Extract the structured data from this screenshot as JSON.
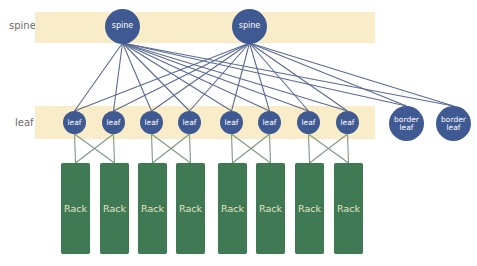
{
  "diagram": {
    "type": "spine-leaf network topology",
    "row_labels": {
      "spine": "spine",
      "leaf": "leaf"
    },
    "colors": {
      "band": "#f8edc8",
      "node": "#3f5a92",
      "node_text": "#ffffff",
      "spine_leaf_link": "#5a6a92",
      "leaf_rack_link": "#7e9a84",
      "rack": "#3f7a55",
      "rack_text": "#e6e4c4",
      "row_label": "#6b6b6b"
    },
    "spines": [
      {
        "label": "spine"
      },
      {
        "label": "spine"
      }
    ],
    "leafs": [
      {
        "label": "leaf"
      },
      {
        "label": "leaf"
      },
      {
        "label": "leaf"
      },
      {
        "label": "leaf"
      },
      {
        "label": "leaf"
      },
      {
        "label": "leaf"
      },
      {
        "label": "leaf"
      },
      {
        "label": "leaf"
      }
    ],
    "border_leafs": [
      {
        "line1": "border",
        "line2": "leaf"
      },
      {
        "line1": "border",
        "line2": "leaf"
      }
    ],
    "racks": [
      {
        "label": "Rack"
      },
      {
        "label": "Rack"
      },
      {
        "label": "Rack"
      },
      {
        "label": "Rack"
      },
      {
        "label": "Rack"
      },
      {
        "label": "Rack"
      },
      {
        "label": "Rack"
      },
      {
        "label": "Rack"
      }
    ],
    "connections": {
      "spine_to_leaf": "full mesh: each spine connects to all 8 leafs and both border leafs",
      "leaf_to_rack": "leaf pairs cross-connected: each leaf links to both racks in its pair"
    }
  }
}
